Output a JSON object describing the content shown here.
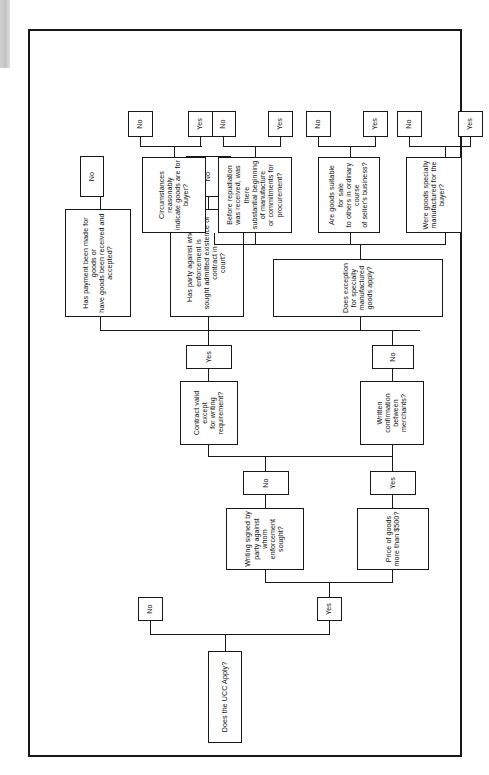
{
  "diagram": {
    "orientation": "rotated-90",
    "frame_color": "#17181a",
    "background": "#ffffff",
    "nodes": {
      "ucc_apply": "Does the UCC Apply?",
      "no_1": "No",
      "yes_1": "Yes",
      "price_500": "Price of goods\nmore than $500?",
      "writing_signed": "Writing signed by\nparty against\nwhom enforcement\nsought?",
      "yes_2": "Yes",
      "no_2": "No",
      "written_conf": "Written confirmation\nbetween merchants?",
      "contract_valid": "Contract valid except\nfor writing requirement?",
      "no_3": "No",
      "yes_3": "Yes",
      "admitted_court": "Has party against whom enforcement is\nsought admitted existence of contract in\ncourt?",
      "payment_made": "Has payment been made for goods or\nhave goods been received and\naccepted?",
      "no_4": "No",
      "no_5": "No",
      "exception": "Does exception\nfor specially manufactured goods apply?",
      "specially_made": "Were goods specially\nmanufactured for the buyer?",
      "yes_4": "Yes",
      "no_6": "No",
      "suitable_sale": "Are goods suitable for sale\nto others in ordinary course\nof seller's business?",
      "yes_5": "Yes",
      "no_7": "No",
      "before_repud": "Before repudiation was received, was there\nsubstantial beginning of manufacture\nor commitments for procurement?",
      "yes_6": "Yes",
      "no_8": "No",
      "circumstances": "Circumstances reasonably\nindicate goods are for buyer?",
      "yes_7": "Yes",
      "no_9": "No"
    }
  }
}
